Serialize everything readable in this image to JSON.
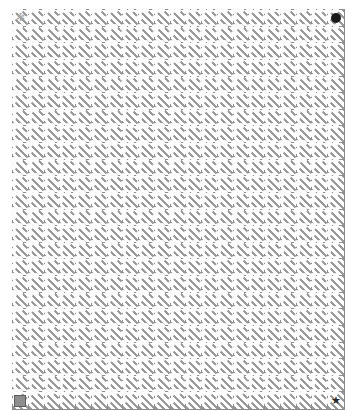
{
  "board": {
    "title": "Hatched Grid Puzzle Board",
    "columns": 21,
    "rows": 24,
    "cell_size_px": 16,
    "grid_line_color": "#8e8e8e",
    "hatch_color": "#9a9a9a",
    "cell_background": "#fefefe",
    "page_background": "#ffffff",
    "hatch_angle_deg": 45,
    "border_color": "#8a8a8a"
  },
  "markers": [
    {
      "id": "start-marker",
      "icon": "asterisk-icon",
      "glyph": "✻",
      "label": "Start",
      "column": 1,
      "row": 1,
      "color": "#a8a8a8"
    },
    {
      "id": "target-dot-marker",
      "icon": "filled-circle-icon",
      "glyph": "",
      "label": "Target",
      "column": 21,
      "row": 1,
      "color": "#1b1b1b"
    },
    {
      "id": "block-square-marker",
      "icon": "filled-square-icon",
      "glyph": "",
      "label": "Block",
      "column": 1,
      "row": 24,
      "color": "#8e8e8e"
    },
    {
      "id": "goal-star-marker",
      "icon": "star-icon",
      "glyph": "★",
      "label": "Goal",
      "column": 21,
      "row": 24,
      "color": "#2a2a2a"
    }
  ]
}
